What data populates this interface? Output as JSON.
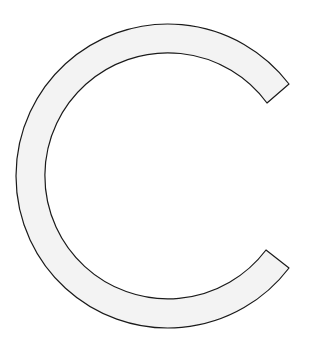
{
  "figure": {
    "glyph": "C",
    "fill_color": "#f3f3f3",
    "stroke_color": "#1a1a1a",
    "background_color": "#ffffff"
  }
}
